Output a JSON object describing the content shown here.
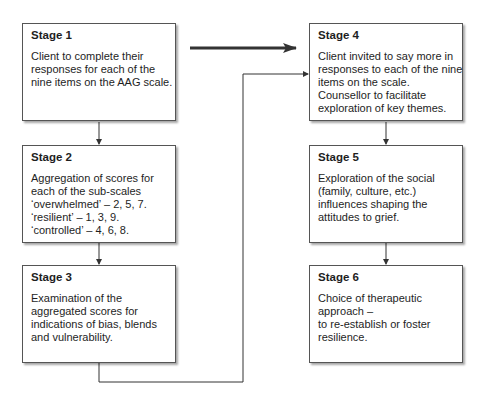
{
  "diagram": {
    "type": "flowchart",
    "stages": [
      {
        "title": "Stage 1",
        "lines": [
          "Client to complete  their",
          "responses for each of the",
          "nine items on the AAG scale."
        ]
      },
      {
        "title": "Stage 2",
        "lines": [
          "Aggregation of scores for",
          "each of the sub-scales",
          "‘overwhelmed’ – 2, 5, 7.",
          "‘resilient’ – 1, 3, 9.",
          "‘controlled’ – 4, 6, 8."
        ]
      },
      {
        "title": "Stage 3",
        "lines": [
          "Examination of the",
          "aggregated scores for",
          "indications of bias, blends",
          "and vulnerability."
        ]
      },
      {
        "title": "Stage 4",
        "lines": [
          "Client invited to say more in",
          "responses to each of the nine",
          "items on the scale.",
          "Counsellor to facilitate",
          "exploration of key themes."
        ]
      },
      {
        "title": "Stage 5",
        "lines": [
          "Exploration of the social",
          "(family, culture, etc.)",
          "influences shaping the",
          "attitudes to grief."
        ]
      },
      {
        "title": "Stage 6",
        "lines": [
          "Choice of therapeutic",
          "approach –",
          "to re-establish or foster",
          "resilience."
        ]
      }
    ],
    "edges": [
      {
        "from": "Stage 1",
        "to": "Stage 2",
        "style": "thin"
      },
      {
        "from": "Stage 2",
        "to": "Stage 3",
        "style": "thin"
      },
      {
        "from": "Stage 3",
        "to": "Stage 4",
        "style": "thin-elbow"
      },
      {
        "from": "Stage 1",
        "to": "Stage 4",
        "style": "thick"
      },
      {
        "from": "Stage 4",
        "to": "Stage 5",
        "style": "thin"
      },
      {
        "from": "Stage 5",
        "to": "Stage 6",
        "style": "thin"
      }
    ],
    "colors": {
      "box_border": "#555555",
      "line": "#333333",
      "thick_arrow": "#333333",
      "background": "#ffffff"
    }
  }
}
